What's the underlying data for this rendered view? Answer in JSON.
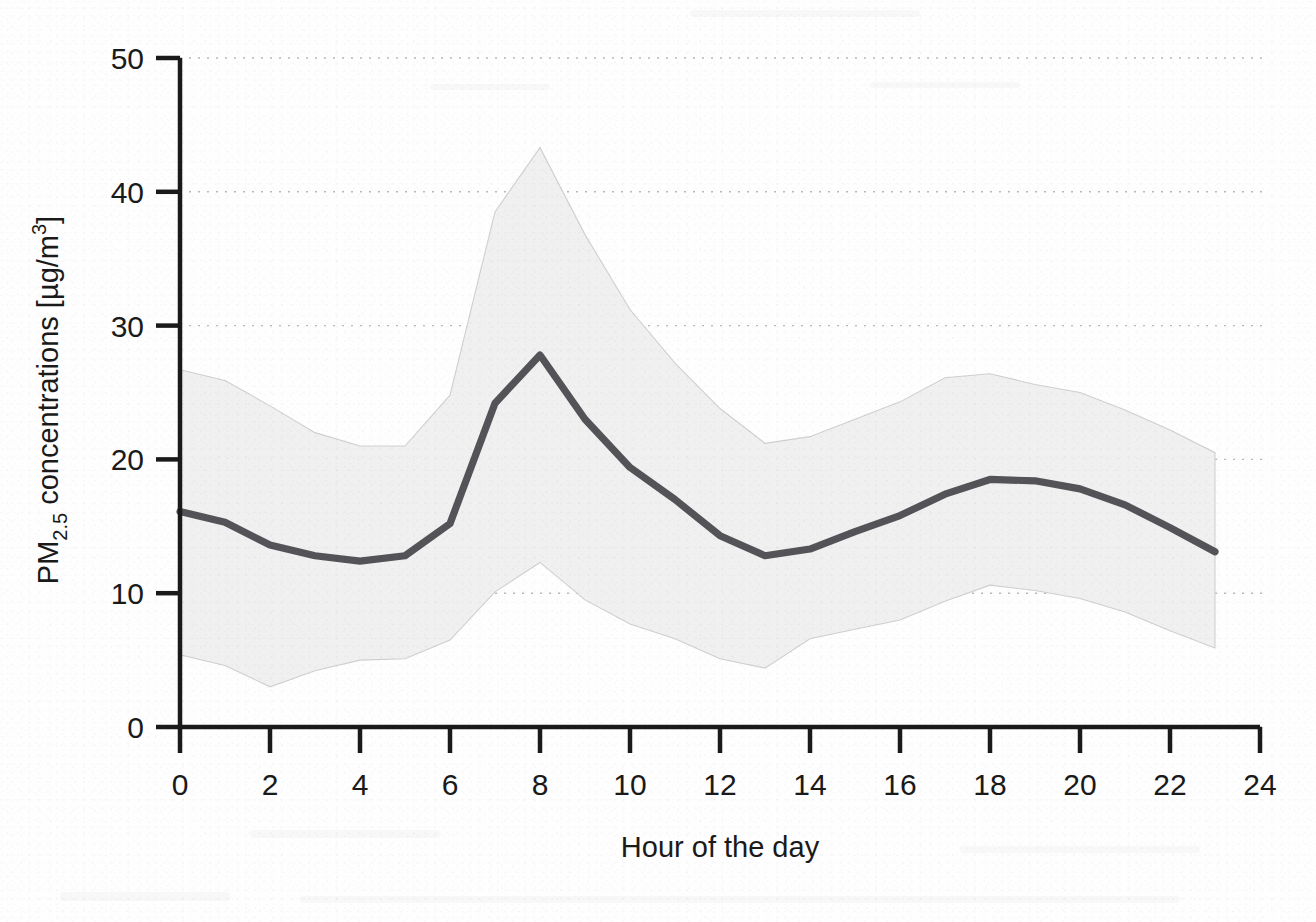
{
  "figure": {
    "background_color": "#fefefe",
    "line_color": "#545458",
    "band_color": "#f0f0f0",
    "band_edge_color": "#cfcfcf",
    "axis_color": "#1a1a1a",
    "grid_color": "#b8b8b8"
  },
  "axes": {
    "y_title_main": "PM",
    "y_title_sub": "2.5",
    "y_title_rest": " concentrations [µg/m",
    "y_title_sup": "3",
    "y_title_close": "]",
    "y_title_plain": "PM2.5 concentrations [µg/m3]",
    "x_title": "Hour of the day",
    "y_ticks": [
      "0",
      "10",
      "20",
      "30",
      "40",
      "50"
    ],
    "x_ticks": [
      "0",
      "2",
      "4",
      "6",
      "8",
      "10",
      "12",
      "14",
      "16",
      "18",
      "20",
      "22",
      "24"
    ]
  },
  "chart_data": {
    "type": "line",
    "title": "",
    "subtitle": "",
    "xlabel": "Hour of the day",
    "ylabel": "PM2.5 concentrations [µg/m3]",
    "xlim": [
      0,
      24
    ],
    "ylim": [
      0,
      50
    ],
    "xtick_step": 2,
    "ytick_step": 10,
    "grid": "horizontal-dotted",
    "legend": "none",
    "x": [
      0,
      1,
      2,
      3,
      4,
      5,
      6,
      7,
      8,
      9,
      10,
      11,
      12,
      13,
      14,
      15,
      16,
      17,
      18,
      19,
      20,
      21,
      22,
      23
    ],
    "series": [
      {
        "name": "Mean PM2.5",
        "style": "solid-thick-line",
        "color": "#545458",
        "values": [
          16.1,
          15.3,
          13.6,
          12.8,
          12.4,
          12.8,
          15.2,
          24.2,
          27.8,
          23.0,
          19.4,
          17.0,
          14.3,
          12.8,
          13.3,
          14.6,
          15.8,
          17.4,
          18.5,
          18.4,
          17.8,
          16.6,
          14.9,
          13.1
        ]
      },
      {
        "name": "Upper bound (shaded band)",
        "style": "band-upper",
        "color": "#f0f0f0",
        "values": [
          26.7,
          25.9,
          24.0,
          22.0,
          21.0,
          21.0,
          24.8,
          38.5,
          43.3,
          36.8,
          31.2,
          27.2,
          23.8,
          21.2,
          21.7,
          23.0,
          24.3,
          26.1,
          26.4,
          25.6,
          25.0,
          23.7,
          22.2,
          20.5
        ]
      },
      {
        "name": "Lower bound (shaded band)",
        "style": "band-lower",
        "color": "#f0f0f0",
        "values": [
          5.4,
          4.6,
          3.0,
          4.2,
          5.0,
          5.1,
          6.5,
          10.1,
          12.3,
          9.5,
          7.7,
          6.6,
          5.1,
          4.4,
          6.6,
          7.3,
          8.0,
          9.4,
          10.6,
          10.2,
          9.6,
          8.6,
          7.2,
          5.9
        ]
      }
    ],
    "annotations": []
  }
}
